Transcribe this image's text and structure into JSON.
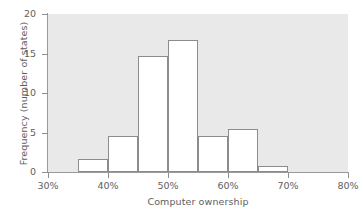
{
  "chart_data": {
    "type": "bar",
    "subtype": "histogram",
    "title": "",
    "xlabel": "Computer ownership",
    "ylabel": "Frequency (number of states)",
    "xlim": [
      30,
      80
    ],
    "ylim": [
      0,
      20
    ],
    "grid": false,
    "legend": null,
    "bin_width": 5,
    "x_tick_labels": [
      "30%",
      "40%",
      "50%",
      "60%",
      "70%",
      "80%"
    ],
    "x_tick_values": [
      30,
      40,
      50,
      60,
      70,
      80
    ],
    "y_tick_labels": [
      "0",
      "5",
      "10",
      "15",
      "20"
    ],
    "y_tick_values": [
      0,
      5,
      10,
      15,
      20
    ],
    "bins": [
      {
        "label": "35%-40%",
        "start": 35,
        "end": 40,
        "value": 1.6
      },
      {
        "label": "40%-45%",
        "start": 40,
        "end": 45,
        "value": 4.5
      },
      {
        "label": "45%-50%",
        "start": 45,
        "end": 50,
        "value": 14.7
      },
      {
        "label": "50%-55%",
        "start": 50,
        "end": 55,
        "value": 16.7
      },
      {
        "label": "55%-60%",
        "start": 55,
        "end": 60,
        "value": 4.5
      },
      {
        "label": "60%-65%",
        "start": 60,
        "end": 65,
        "value": 5.4
      },
      {
        "label": "65%-70%",
        "start": 65,
        "end": 70,
        "value": 0.7
      }
    ],
    "colors": {
      "plot_background": "#e9e9e9",
      "bar_fill": "#ffffff",
      "bar_stroke": "#8c8c8c",
      "axis": "#9a9a9a",
      "text": "#5e5e5e",
      "page_background": "#ffffff"
    }
  }
}
